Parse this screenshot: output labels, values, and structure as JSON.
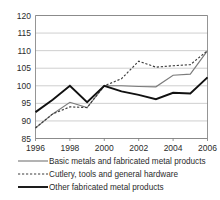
{
  "chart_data": {
    "type": "line",
    "title": "",
    "subtitle": "",
    "xlabel": "",
    "ylabel": "",
    "xlim": [
      1996,
      2006
    ],
    "ylim": [
      85,
      120
    ],
    "yticks": [
      85,
      90,
      95,
      100,
      105,
      110,
      115,
      120
    ],
    "ytick_labels": [
      "85",
      "90",
      "95",
      "100",
      "105",
      "110",
      "115",
      "120"
    ],
    "xticks": [
      1996,
      1998,
      2000,
      2002,
      2004,
      2006
    ],
    "xtick_labels": [
      "1996",
      "1998",
      "2000",
      "2002",
      "2004",
      "2006"
    ],
    "x": [
      1996,
      1997,
      1998,
      1999,
      2000,
      2001,
      2002,
      2003,
      2004,
      2005,
      2006
    ],
    "grid": "horizontal",
    "legend_position": "bottom",
    "series": [
      {
        "name": "Basic metals and fabricated metal products",
        "style": "solid",
        "color": "#7b7b7b",
        "values": [
          88.0,
          92.0,
          95.3,
          93.8,
          100.0,
          100.0,
          99.8,
          99.7,
          103.0,
          103.3,
          110.0
        ]
      },
      {
        "name": "Cutlery, tools and general hardware",
        "style": "dotted",
        "color": "#3c3c3c",
        "values": [
          88.0,
          92.0,
          94.0,
          93.8,
          100.0,
          102.0,
          107.0,
          105.3,
          105.7,
          106.0,
          110.0
        ]
      },
      {
        "name": "Other fabricated metal products",
        "style": "solid-thick",
        "color": "#111111",
        "values": [
          92.5,
          96.0,
          100.0,
          95.3,
          100.0,
          98.4,
          97.4,
          96.2,
          98.0,
          97.8,
          102.4
        ]
      }
    ]
  },
  "legend": {
    "items": [
      {
        "label": "Basic metals and fabricated metal products",
        "swatch": "solid-thin-gray"
      },
      {
        "label": "Cutlery, tools and general hardware",
        "swatch": "dotted-dark"
      },
      {
        "label": "Other fabricated metal products",
        "swatch": "solid-thick-black"
      }
    ]
  }
}
